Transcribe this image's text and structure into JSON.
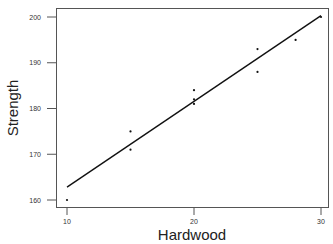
{
  "chart_data": {
    "type": "scatter",
    "title": "",
    "xlabel": "Hardwood",
    "ylabel": "Strength",
    "xlim": [
      9.2,
      30.6
    ],
    "ylim": [
      158.5,
      202
    ],
    "xticks": [
      10,
      20,
      30
    ],
    "yticks": [
      160,
      170,
      180,
      190,
      200
    ],
    "grid": false,
    "legend": null,
    "series": [
      {
        "name": "observations",
        "kind": "scatter",
        "points": [
          {
            "x": 10,
            "y": 160
          },
          {
            "x": 15,
            "y": 175
          },
          {
            "x": 15,
            "y": 171
          },
          {
            "x": 20,
            "y": 184
          },
          {
            "x": 20,
            "y": 182
          },
          {
            "x": 20,
            "y": 181
          },
          {
            "x": 25,
            "y": 193
          },
          {
            "x": 25,
            "y": 188
          },
          {
            "x": 28,
            "y": 195
          },
          {
            "x": 30,
            "y": 200
          }
        ]
      },
      {
        "name": "fitted line",
        "kind": "line",
        "points": [
          {
            "x": 10,
            "y": 162.8
          },
          {
            "x": 30,
            "y": 200.3
          }
        ]
      }
    ]
  },
  "colors": {
    "frame": "#555555",
    "points": "#111111",
    "line": "#111111"
  }
}
